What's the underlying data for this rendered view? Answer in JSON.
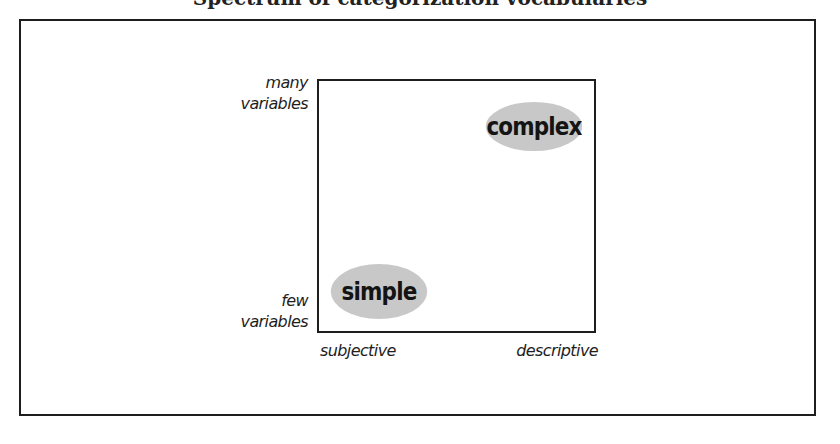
{
  "title": {
    "text": "Spectrum of categorization vocabularies",
    "visible": "partially cut off at top edge"
  },
  "diagram": {
    "y_axis": {
      "top_label": [
        "many",
        "variables"
      ],
      "bottom_label": [
        "few",
        "variables"
      ]
    },
    "x_axis": {
      "left_label": "subjective",
      "right_label": "descriptive"
    },
    "regions": [
      {
        "label": "complex",
        "position": "top-right",
        "fill": "#c8c8c8"
      },
      {
        "label": "simple",
        "position": "bottom-left",
        "fill": "#c8c8c8"
      }
    ],
    "colors": {
      "frame": "#1e1e1e",
      "ellipse_fill": "#c8c8c8",
      "text": "#1a1a1a",
      "background": "#ffffff"
    }
  }
}
